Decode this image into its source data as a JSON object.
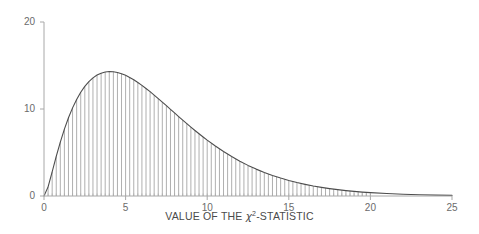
{
  "chart_data": {
    "type": "area",
    "title": "",
    "subtitle": "",
    "xlabel_prefix": "VALUE OF THE ",
    "xlabel_symbol": "χ",
    "xlabel_exponent": "2",
    "xlabel_suffix": "-STATISTIC",
    "xlabel": "VALUE OF THE χ²-STATISTIC",
    "ylabel": "",
    "xlim": [
      0,
      25
    ],
    "ylim": [
      0,
      20
    ],
    "xticks": [
      0,
      5,
      10,
      15,
      20,
      25
    ],
    "xtick_labels": [
      "0",
      "5",
      "10",
      "15",
      "20",
      "25"
    ],
    "yticks": [
      0,
      10,
      20
    ],
    "ytick_labels": [
      "0",
      "10",
      "20"
    ],
    "grid": false,
    "legend": "none",
    "minor_tick_step": 0.25,
    "curve_color": "#4d4d4d",
    "bar_color": "#9a9a9a",
    "axis_color": "#a8a8a8",
    "text_color": "#6b6b6b",
    "distribution": "chi-square density (df = 5), scaled",
    "peak": {
      "x": 3.0,
      "y": 16.1
    },
    "series": [
      {
        "name": "chi-square density",
        "x": [
          0.0,
          0.25,
          0.5,
          0.75,
          1.0,
          1.25,
          1.5,
          1.75,
          2.0,
          2.25,
          2.5,
          2.75,
          3.0,
          3.25,
          3.5,
          3.75,
          4.0,
          4.25,
          4.5,
          4.75,
          5.0,
          5.25,
          5.5,
          5.75,
          6.0,
          6.25,
          6.5,
          6.75,
          7.0,
          7.25,
          7.5,
          7.75,
          8.0,
          8.25,
          8.5,
          8.75,
          9.0,
          9.25,
          9.5,
          9.75,
          10.0,
          10.5,
          11.0,
          11.5,
          12.0,
          12.5,
          13.0,
          13.5,
          14.0,
          14.5,
          15.0,
          15.5,
          16.0,
          16.5,
          17.0,
          17.5,
          18.0,
          18.5,
          19.0,
          19.5,
          20.0,
          21.0,
          22.0,
          23.0,
          24.0,
          25.0
        ],
        "values": [
          0.0,
          1.05,
          2.78,
          4.55,
          6.2,
          7.69,
          9.0,
          10.13,
          11.1,
          11.92,
          12.6,
          13.15,
          13.58,
          13.9,
          14.12,
          14.26,
          14.31,
          14.29,
          14.2,
          14.06,
          13.87,
          13.63,
          13.36,
          13.05,
          12.72,
          12.36,
          11.99,
          11.6,
          11.2,
          10.79,
          10.38,
          9.96,
          9.55,
          9.13,
          8.72,
          8.32,
          7.92,
          7.53,
          7.15,
          6.78,
          6.42,
          5.74,
          5.11,
          4.53,
          4.0,
          3.52,
          3.09,
          2.71,
          2.36,
          2.06,
          1.79,
          1.55,
          1.34,
          1.15,
          0.99,
          0.85,
          0.73,
          0.62,
          0.53,
          0.45,
          0.39,
          0.28,
          0.2,
          0.14,
          0.1,
          0.07
        ]
      }
    ],
    "bars": {
      "name": "simulated histogram",
      "bin_width": 0.25,
      "x": [
        0.25,
        0.5,
        0.75,
        1.0,
        1.25,
        1.5,
        1.75,
        2.0,
        2.25,
        2.5,
        2.75,
        3.0,
        3.25,
        3.5,
        3.75,
        4.0,
        4.25,
        4.5,
        4.75,
        5.0,
        5.25,
        5.5,
        5.75,
        6.0,
        6.25,
        6.5,
        6.75,
        7.0,
        7.25,
        7.5,
        7.75,
        8.0,
        8.25,
        8.5,
        8.75,
        9.0,
        9.25,
        9.5,
        9.75,
        10.0,
        10.25,
        10.5,
        10.75,
        11.0,
        11.25,
        11.5,
        11.75,
        12.0,
        12.25,
        12.5,
        12.75,
        13.0,
        13.25,
        13.5,
        13.75,
        14.0,
        14.25,
        14.5,
        14.75,
        15.0,
        15.25,
        15.5,
        15.75,
        16.0,
        16.25,
        16.5,
        16.75,
        17.0,
        17.25,
        17.5,
        17.75,
        18.0,
        18.25,
        18.5,
        18.75,
        19.0,
        19.25,
        19.5,
        19.75,
        20.0
      ],
      "values": [
        1.05,
        2.78,
        4.55,
        6.2,
        7.69,
        9.0,
        10.13,
        11.1,
        11.92,
        12.6,
        13.15,
        13.58,
        13.9,
        14.12,
        14.26,
        14.31,
        14.29,
        14.2,
        14.06,
        13.87,
        13.63,
        13.36,
        13.05,
        12.72,
        12.36,
        11.99,
        11.6,
        11.2,
        10.79,
        10.38,
        9.96,
        9.55,
        9.13,
        8.72,
        8.32,
        7.92,
        7.53,
        7.15,
        6.78,
        6.42,
        6.07,
        5.74,
        5.42,
        5.11,
        4.81,
        4.53,
        4.26,
        4.0,
        3.75,
        3.52,
        3.3,
        3.09,
        2.89,
        2.71,
        2.53,
        2.36,
        2.2,
        2.06,
        1.92,
        1.79,
        1.66,
        1.55,
        1.44,
        1.34,
        1.24,
        1.15,
        1.07,
        0.99,
        0.92,
        0.85,
        0.79,
        0.73,
        0.67,
        0.62,
        0.58,
        0.53,
        0.49,
        0.45,
        0.42,
        0.39
      ]
    }
  }
}
